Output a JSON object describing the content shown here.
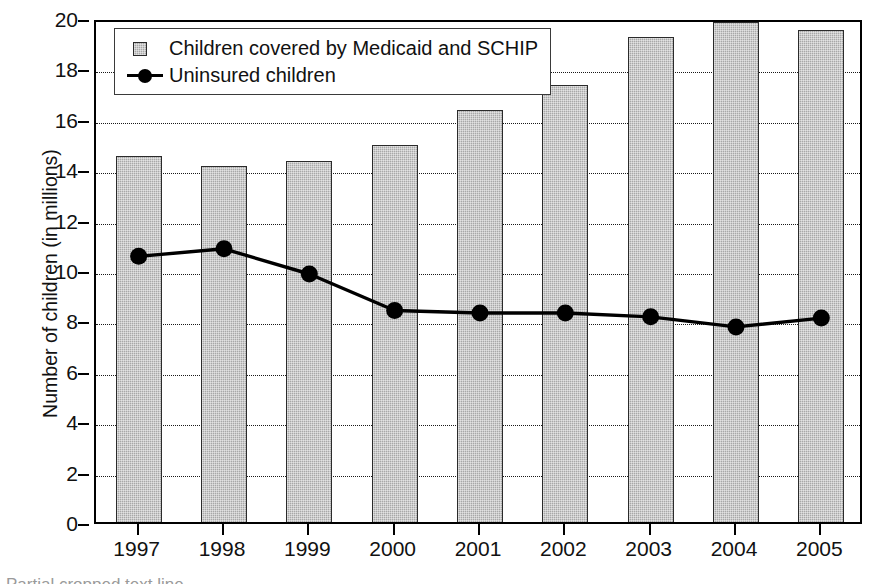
{
  "chart_data": {
    "type": "bar",
    "title": "",
    "subtitle": "",
    "xlabel": "",
    "ylabel": "Number of children (in millions)",
    "categories": [
      "1997",
      "1998",
      "1999",
      "2000",
      "2001",
      "2002",
      "2003",
      "2004",
      "2005"
    ],
    "ylim": [
      0,
      20
    ],
    "ytick_step": 2,
    "yticks": [
      "0",
      "2",
      "4",
      "6",
      "8",
      "10",
      "12",
      "14",
      "16",
      "18",
      "20"
    ],
    "grid": "horizontal-dotted",
    "legend_position": "top-left-inside",
    "series": [
      {
        "name": "Children covered by Medicaid and SCHIP",
        "type": "bar",
        "color": "#a8a8a8",
        "edge_color": "#2b2b2b",
        "values": [
          14.7,
          14.3,
          14.5,
          15.1,
          16.5,
          17.5,
          19.4,
          20.0,
          19.7
        ]
      },
      {
        "name": "Uninsured children",
        "type": "line",
        "color": "#000000",
        "marker": "filled-circle",
        "values": [
          10.7,
          11.0,
          10.0,
          8.55,
          8.45,
          8.45,
          8.3,
          7.9,
          8.25
        ]
      }
    ]
  },
  "legend": {
    "items": [
      {
        "label": "Children covered by Medicaid and SCHIP",
        "key": "filled-square-swatch"
      },
      {
        "label": "Uninsured children",
        "key": "line-with-dot-swatch"
      }
    ]
  },
  "caption_sliver": "Partial cropped text line"
}
